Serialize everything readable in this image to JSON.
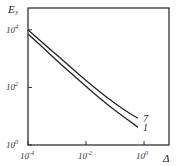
{
  "chart_data": {
    "type": "line",
    "title": "",
    "xlabel": "Δ",
    "ylabel": "E",
    "ylabel_sub": "3",
    "xscale": "log",
    "yscale": "log",
    "xlim_log10": [
      -4,
      0.86
    ],
    "ylim_log10": [
      0,
      4.76
    ],
    "grid": false,
    "legend": "inline-labels-right",
    "x_ticks": [
      {
        "log10": -4,
        "base": "10",
        "exp": "-4"
      },
      {
        "log10": -2,
        "base": "10",
        "exp": "-2"
      },
      {
        "log10": 0,
        "base": "10",
        "exp": "0"
      }
    ],
    "y_ticks": [
      {
        "log10": 0,
        "base": "10",
        "exp": "0"
      },
      {
        "log10": 2,
        "base": "10",
        "exp": "2"
      },
      {
        "log10": 4,
        "base": "10",
        "exp": "4"
      }
    ],
    "series": [
      {
        "name": "7",
        "label": "7",
        "x_log10": [
          -4,
          -3.5,
          -3,
          -2.5,
          -2,
          -1.5,
          -1,
          -0.5,
          -0.21
        ],
        "y_log10": [
          4.0,
          3.55,
          3.12,
          2.68,
          2.24,
          1.82,
          1.44,
          1.1,
          0.93
        ]
      },
      {
        "name": "1",
        "label": "1",
        "x_log10": [
          -4,
          -3.5,
          -3,
          -2.5,
          -2,
          -1.5,
          -1,
          -0.5,
          -0.21
        ],
        "y_log10": [
          3.86,
          3.4,
          2.93,
          2.48,
          2.03,
          1.6,
          1.2,
          0.83,
          0.62
        ]
      }
    ]
  }
}
